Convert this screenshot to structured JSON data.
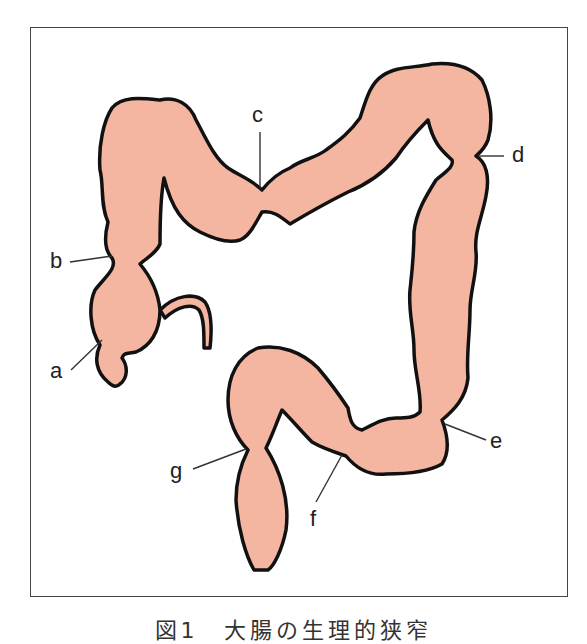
{
  "figure": {
    "caption": "図1　大腸の生理的狭窄",
    "fill_color": "#F4B6A0",
    "outline_color": "#111111",
    "labels": [
      {
        "id": "a",
        "text": "a"
      },
      {
        "id": "b",
        "text": "b"
      },
      {
        "id": "c",
        "text": "c"
      },
      {
        "id": "d",
        "text": "d"
      },
      {
        "id": "e",
        "text": "e"
      },
      {
        "id": "f",
        "text": "f"
      },
      {
        "id": "g",
        "text": "g"
      }
    ]
  }
}
